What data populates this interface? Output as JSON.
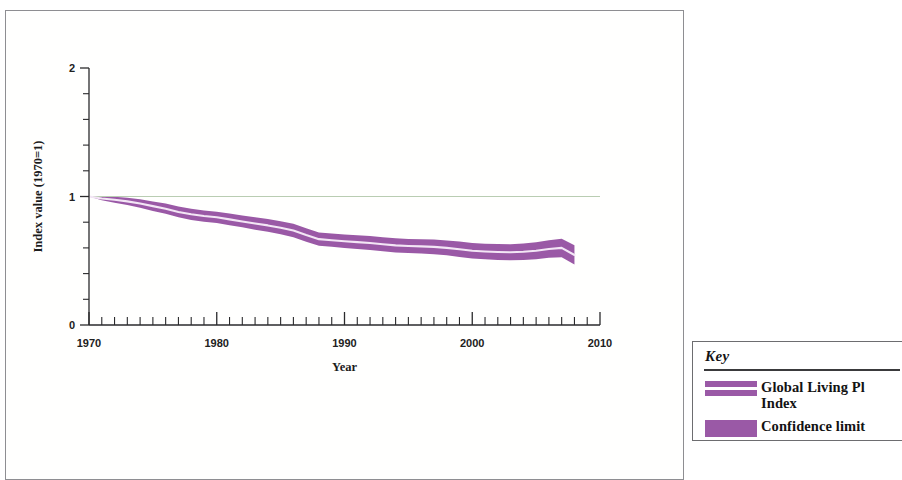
{
  "figure": {
    "background_color": "#ffffff",
    "frame_color": "#8e8e92"
  },
  "legend": {
    "title": "Key",
    "items": [
      {
        "label": "Global Living Pl\nIndex",
        "swatch": "double-line",
        "color": "#9a59a6"
      },
      {
        "label": "Confidence limit",
        "swatch": "solid-block",
        "color": "#9a59a6"
      }
    ]
  },
  "chart_data": {
    "type": "line",
    "title": "",
    "xlabel": "Year",
    "ylabel": "Index value (1970=1)",
    "xlim": [
      1970,
      2010
    ],
    "ylim": [
      0,
      2
    ],
    "xticks": [
      1970,
      1980,
      1990,
      2000,
      2010
    ],
    "xtick_labels": [
      "1970",
      "1980",
      "1990",
      "2000",
      "2010"
    ],
    "x_minor_tick_interval": 1,
    "yticks": [
      0,
      1,
      2
    ],
    "ytick_labels": [
      "0",
      "1",
      "2"
    ],
    "y_minor_tick_interval": 0.2,
    "grid": false,
    "legend_position": "outside-right",
    "reference_line": {
      "y": 1,
      "color": "#b9cdb2"
    },
    "line_color": "#f2e4f4",
    "band_color": "#9a59a6",
    "x": [
      1970,
      1971,
      1972,
      1973,
      1974,
      1975,
      1976,
      1977,
      1978,
      1979,
      1980,
      1981,
      1982,
      1983,
      1984,
      1985,
      1986,
      1987,
      1988,
      1989,
      1990,
      1991,
      1992,
      1993,
      1994,
      1995,
      1996,
      1997,
      1998,
      1999,
      2000,
      2001,
      2002,
      2003,
      2004,
      2005,
      2006,
      2007,
      2008
    ],
    "series": [
      {
        "name": "Global Living Planet Index",
        "values": [
          1.0,
          0.985,
          0.975,
          0.962,
          0.945,
          0.925,
          0.905,
          0.88,
          0.862,
          0.848,
          0.838,
          0.822,
          0.806,
          0.79,
          0.775,
          0.757,
          0.735,
          0.7,
          0.668,
          0.66,
          0.652,
          0.645,
          0.638,
          0.628,
          0.62,
          0.615,
          0.612,
          0.608,
          0.6,
          0.59,
          0.578,
          0.572,
          0.568,
          0.566,
          0.57,
          0.578,
          0.592,
          0.6,
          0.545
        ]
      },
      {
        "name": "Confidence limit upper",
        "values": [
          1.0,
          1.0,
          0.998,
          0.99,
          0.978,
          0.962,
          0.945,
          0.922,
          0.905,
          0.892,
          0.882,
          0.868,
          0.852,
          0.838,
          0.824,
          0.808,
          0.788,
          0.752,
          0.72,
          0.712,
          0.705,
          0.698,
          0.692,
          0.682,
          0.675,
          0.67,
          0.668,
          0.665,
          0.658,
          0.65,
          0.638,
          0.633,
          0.63,
          0.628,
          0.634,
          0.644,
          0.66,
          0.672,
          0.62
        ]
      },
      {
        "name": "Confidence limit lower",
        "values": [
          1.0,
          0.97,
          0.952,
          0.934,
          0.912,
          0.888,
          0.865,
          0.838,
          0.818,
          0.804,
          0.794,
          0.776,
          0.76,
          0.742,
          0.726,
          0.706,
          0.682,
          0.648,
          0.616,
          0.608,
          0.599,
          0.592,
          0.584,
          0.574,
          0.565,
          0.56,
          0.556,
          0.551,
          0.542,
          0.53,
          0.518,
          0.511,
          0.506,
          0.504,
          0.506,
          0.512,
          0.524,
          0.528,
          0.47
        ]
      }
    ]
  }
}
